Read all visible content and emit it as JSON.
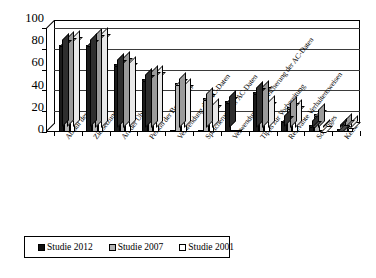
{
  "chart_data": {
    "type": "bar",
    "title": "",
    "subtitle": "",
    "xlabel": "",
    "ylabel": "",
    "ylim": [
      0,
      100
    ],
    "yticks": [
      0,
      20,
      40,
      60,
      80,
      100
    ],
    "grid": true,
    "legend_position": "bottom",
    "style": "3d-grouped-columns",
    "categories": [
      "Ablauf des AC",
      "Zielsetzung des AC",
      "Art der Übungen",
      "Person der Beobachter",
      "Verwendung der AC-Daten",
      "Speicherung der AC-Daten",
      "Verwendung & Speicherung der AC-Daten",
      "Tipps zur Vorbereitung",
      "Relevante Verhaltensweisen",
      "Sonstiges",
      "Keine"
    ],
    "series": [
      {
        "name": "Studie 2012",
        "color": "#1a1a1a",
        "values": [
          84,
          84,
          65,
          51,
          0,
          0,
          30,
          38,
          11,
          7,
          3
        ]
      },
      {
        "name": "Studie 2007",
        "color": "#b3b3b3",
        "values": [
          86,
          89,
          67,
          54,
          47,
          33,
          0,
          39,
          24,
          17,
          8
        ]
      },
      {
        "name": "Studie 2001",
        "color": "#ffffff",
        "values": [
          87,
          90,
          62,
          54,
          41,
          22,
          0,
          25,
          21,
          2,
          6
        ]
      }
    ]
  },
  "axis": {
    "y_tick_labels": [
      "100",
      "80",
      "60",
      "40",
      "20",
      "0"
    ]
  },
  "legend": {
    "items": [
      {
        "label": "Studie 2012",
        "swatch": "black-square-icon"
      },
      {
        "label": "Studie 2007",
        "swatch": "gray-square-icon"
      },
      {
        "label": "Studie 2001",
        "swatch": "white-square-icon"
      }
    ]
  }
}
